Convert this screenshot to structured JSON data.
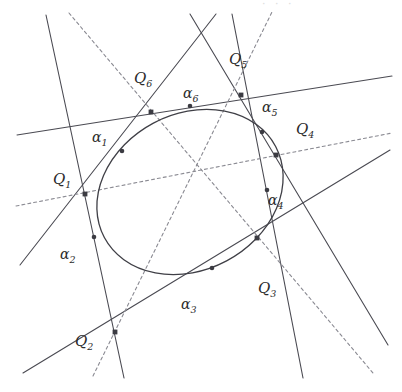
{
  "figure": {
    "width": 402,
    "height": 392,
    "background": "#ffffff",
    "artifact_text": "· · ·"
  },
  "style": {
    "solid_color": "#4a4a52",
    "dashed_color": "#8a8a92",
    "conic_color": "#3f3f46",
    "point_color": "#3b3b42",
    "label_color": "#2b2b2b",
    "solid_width": 1.1,
    "dashed_width": 1.1,
    "conic_width": 1.3,
    "dash_pattern": "3,3"
  },
  "conic": {
    "type": "ellipse",
    "cx": 190,
    "cy": 192,
    "rx": 97,
    "ry": 78,
    "rotation_deg": -28
  },
  "vertices": [
    {
      "id": "Q1",
      "label": "Q",
      "sub": "1",
      "x": 85,
      "y": 194,
      "label_x": 53,
      "label_y": 172
    },
    {
      "id": "Q2",
      "label": "Q",
      "sub": "2",
      "x": 115,
      "y": 332,
      "label_x": 75,
      "label_y": 334
    },
    {
      "id": "Q3",
      "label": "Q",
      "sub": "3",
      "x": 257,
      "y": 238,
      "label_x": 258,
      "label_y": 281
    },
    {
      "id": "Q4",
      "label": "Q",
      "sub": "4",
      "x": 276,
      "y": 155,
      "label_x": 296,
      "label_y": 122
    },
    {
      "id": "Q5",
      "label": "Q",
      "sub": "5",
      "x": 241,
      "y": 95,
      "label_x": 229,
      "label_y": 52
    },
    {
      "id": "Q6",
      "label": "Q",
      "sub": "6",
      "x": 151,
      "y": 112,
      "label_x": 134,
      "label_y": 71
    }
  ],
  "tangency_points": [
    {
      "id": "a1",
      "label": "α",
      "sub": "1",
      "x": 122,
      "y": 151,
      "label_x": 92,
      "label_y": 130
    },
    {
      "id": "a2",
      "label": "α",
      "sub": "2",
      "x": 94,
      "y": 237,
      "label_x": 60,
      "label_y": 247
    },
    {
      "id": "a3",
      "label": "α",
      "sub": "3",
      "x": 212,
      "y": 268,
      "label_x": 181,
      "label_y": 297
    },
    {
      "id": "a4",
      "label": "α",
      "sub": "4",
      "x": 267,
      "y": 190,
      "label_x": 268,
      "label_y": 193
    },
    {
      "id": "a5",
      "label": "α",
      "sub": "5",
      "x": 262,
      "y": 132,
      "label_x": 262,
      "label_y": 100
    },
    {
      "id": "a6",
      "label": "α",
      "sub": "6",
      "x": 190,
      "y": 106,
      "label_x": 183,
      "label_y": 86
    }
  ],
  "tangent_lines": [
    {
      "id": "t1",
      "from": "Q1",
      "to": "Q6",
      "through": "a1",
      "x1": 20,
      "y1": 265,
      "x2": 216,
      "y2": 14
    },
    {
      "id": "t2",
      "from": "Q1",
      "to": "Q2",
      "through": "a2",
      "x1": 46,
      "y1": 15,
      "x2": 124,
      "y2": 378
    },
    {
      "id": "t3",
      "from": "Q2",
      "to": "Q3",
      "through": "a3",
      "x1": 23,
      "y1": 373,
      "x2": 390,
      "y2": 150
    },
    {
      "id": "t4",
      "from": "Q3",
      "to": "Q4",
      "through": "a4",
      "x1": 232,
      "y1": 14,
      "x2": 303,
      "y2": 378
    },
    {
      "id": "t5",
      "from": "Q4",
      "to": "Q5",
      "through": "a5",
      "x1": 190,
      "y1": 14,
      "x2": 388,
      "y2": 345
    },
    {
      "id": "t6",
      "from": "Q5",
      "to": "Q6",
      "through": "a6",
      "x1": 17,
      "y1": 135,
      "x2": 392,
      "y2": 76
    }
  ],
  "diagonals": [
    {
      "id": "d14",
      "from": "Q1",
      "to": "Q4",
      "x1": 16,
      "y1": 206,
      "x2": 392,
      "y2": 133
    },
    {
      "id": "d25",
      "from": "Q2",
      "to": "Q5",
      "x1": 93,
      "y1": 376,
      "x2": 272,
      "y2": 12
    },
    {
      "id": "d36",
      "from": "Q3",
      "to": "Q6",
      "x1": 69,
      "y1": 13,
      "x2": 373,
      "y2": 373
    }
  ],
  "brianchon_point": {
    "x": 200,
    "y": 172
  }
}
